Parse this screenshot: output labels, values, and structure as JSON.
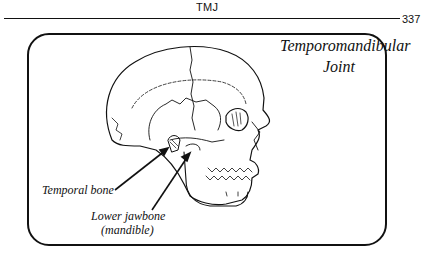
{
  "running_head": {
    "title": "TMJ",
    "page_number": "337"
  },
  "figure": {
    "title_line1": "Temporomandibular",
    "title_line2": "Joint",
    "labels": {
      "temporal_bone": "Temporal bone",
      "lower_jawbone_line1": "Lower jawbone",
      "lower_jawbone_line2": "(mandible)"
    },
    "illustration": "skull-side-view"
  }
}
